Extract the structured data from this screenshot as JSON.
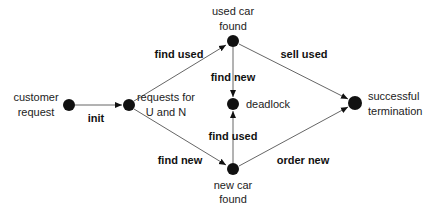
{
  "diagram": {
    "type": "state-transition",
    "nodes": [
      {
        "id": "customer_request",
        "label_lines": [
          "customer",
          "request"
        ],
        "x": 69,
        "y": 105
      },
      {
        "id": "requests_UN",
        "label_lines": [
          "requests for",
          "U and N"
        ],
        "x": 129,
        "y": 105
      },
      {
        "id": "used_car_found",
        "label_lines": [
          "used car",
          "found"
        ],
        "x": 233,
        "y": 41
      },
      {
        "id": "deadlock",
        "label_lines": [
          "deadlock"
        ],
        "x": 233,
        "y": 104
      },
      {
        "id": "new_car_found",
        "label_lines": [
          "new car",
          "found"
        ],
        "x": 233,
        "y": 169
      },
      {
        "id": "successful_termination",
        "label_lines": [
          "successful",
          "termination"
        ],
        "x": 355,
        "y": 103
      }
    ],
    "edges": [
      {
        "from": "customer_request",
        "to": "requests_UN",
        "label": "init"
      },
      {
        "from": "requests_UN",
        "to": "used_car_found",
        "label": "find used"
      },
      {
        "from": "requests_UN",
        "to": "new_car_found",
        "label": "find new"
      },
      {
        "from": "used_car_found",
        "to": "deadlock",
        "label": "find new"
      },
      {
        "from": "new_car_found",
        "to": "deadlock",
        "label": "find used"
      },
      {
        "from": "used_car_found",
        "to": "successful_termination",
        "label": "sell used"
      },
      {
        "from": "new_car_found",
        "to": "successful_termination",
        "label": "order new"
      }
    ]
  }
}
